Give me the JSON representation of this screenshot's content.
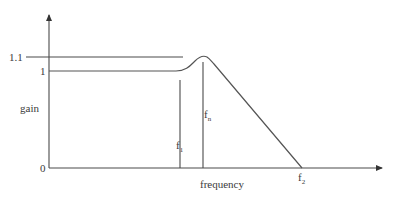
{
  "diagram": {
    "type": "frequency-response",
    "axes": {
      "y_label": "gain",
      "x_label": "frequency",
      "y_ticks": [
        {
          "label": "1.1",
          "value": 1.1
        },
        {
          "label": "1",
          "value": 1.0
        },
        {
          "label": "0",
          "value": 0
        }
      ]
    },
    "markers": [
      {
        "id": "f1",
        "base": "f",
        "sub": "1"
      },
      {
        "id": "fn",
        "base": "f",
        "sub": "n"
      },
      {
        "id": "f2",
        "base": "f",
        "sub": "2"
      }
    ],
    "colors": {
      "line": "#4a4a4a",
      "text": "#3a3a3a",
      "background": "#ffffff"
    }
  }
}
